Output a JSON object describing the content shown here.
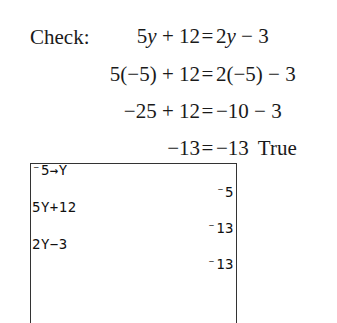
{
  "check": {
    "label": "Check:",
    "lines": [
      {
        "lhs": "5y + 12",
        "eq": "=",
        "rhs": "2y − 3",
        "verdict": ""
      },
      {
        "lhs": "5(−5) + 12",
        "eq": "=",
        "rhs": "2(−5) − 3",
        "verdict": ""
      },
      {
        "lhs": "−25 + 12",
        "eq": "=",
        "rhs": "−10 − 3",
        "verdict": ""
      },
      {
        "lhs": "−13",
        "eq": "=",
        "rhs": "−13",
        "verdict": "True"
      }
    ]
  },
  "calculator": {
    "rows": [
      {
        "entry": "⁻5→Y",
        "result": "⁻5"
      },
      {
        "entry": "5Y+12",
        "result": "⁻13"
      },
      {
        "entry": "2Y−3",
        "result": "⁻13"
      }
    ]
  }
}
